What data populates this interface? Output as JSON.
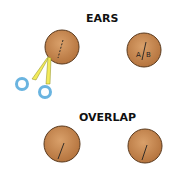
{
  "titles": {
    "ears": "EARS",
    "overlap": "OVERLAP"
  },
  "labels": {
    "ab_a": "A",
    "ab_b": "B"
  },
  "colors": {
    "dough": "#c68a55",
    "dough_edge": "#5a3a1e",
    "scissor_blade": "#f2ea5a",
    "scissor_handle": "#6ab4e0"
  },
  "icons": [
    "dough-circle-icon",
    "scissors-icon"
  ]
}
